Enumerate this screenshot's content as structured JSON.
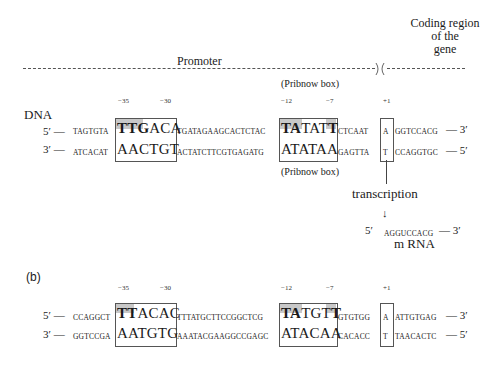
{
  "header": {
    "promoter_label": "Promoter",
    "coding_label_line1": "Coding region",
    "coding_label_line2": "of the",
    "coding_label_line3": "gene"
  },
  "panel_a": {
    "dna_label": "DNA",
    "positions": {
      "m35": "−35",
      "m30": "−30",
      "m12": "−12",
      "m7": "−7",
      "p1": "+1"
    },
    "pribnow_top": "(Pribnow box)",
    "pribnow_bottom": "(Pribnow box)",
    "top_strand": {
      "start": "5′ —",
      "left_flank": "TAGTGTA",
      "box35_bold": "TTG",
      "box35_rest": "ACA",
      "spacer": "TGATAGAAGCACTCTAC",
      "box10_bold1": "TA",
      "box10_mid": "TAT",
      "box10_bold2": "T",
      "after10": "CTCAAT",
      "start_base": "A",
      "coding": "GGTCCACG",
      "end": "— 3′"
    },
    "bottom_strand": {
      "start": "3′ —",
      "left_flank": "ATCACAT",
      "box35": "AACTGT",
      "spacer": "ACTATCTTCGTGAGATG",
      "box10": "ATATAA",
      "after10": "GAGTTA",
      "start_base": "T",
      "coding": "CCAGGTGC",
      "end": "— 5′"
    },
    "transcription_label": "transcription",
    "arrow": "↓",
    "mrna": {
      "start": "5′",
      "sequence": "AGGUCCACG",
      "end": "— 3′",
      "label": "m RNA"
    }
  },
  "panel_b": {
    "label": "(b)",
    "positions": {
      "m35": "−35",
      "m30": "−30",
      "m12": "−12",
      "m7": "−7",
      "p1": "+1"
    },
    "top_strand": {
      "start": "5′ —",
      "left_flank": "CCAGGCT",
      "box35_bold": "TT",
      "box35_rest": "ACAC",
      "spacer": "TTTATGCTTCCGGCTCG",
      "box10_bold1": "TA",
      "box10_mid": "TGT",
      "box10_bold2": "T",
      "after10": "GTGTGG",
      "start_base": "A",
      "coding": "ATTGTGAG",
      "end": "— 3′"
    },
    "bottom_strand": {
      "start": "3′ —",
      "left_flank": "GGTCCGA",
      "box35": "AATGTG",
      "spacer": "AAATACGAAGGCCGAGC",
      "box10": "ATACAA",
      "after10": "CACACC",
      "start_base": "T",
      "coding": "TAACACTC",
      "end": "— 5′"
    }
  },
  "colors": {
    "shade": "#c8c8c8",
    "line": "#555555",
    "text": "#1a1a1a"
  }
}
